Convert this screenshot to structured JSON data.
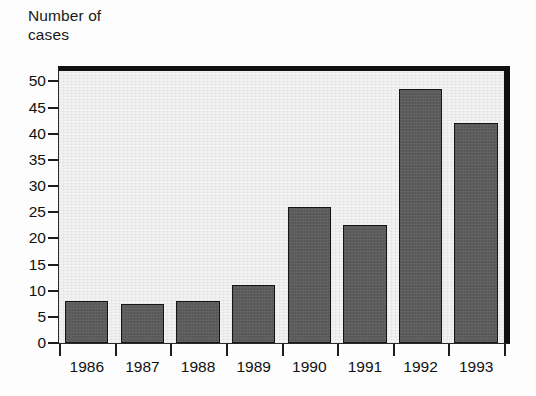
{
  "figure": {
    "background_color": "#fdfdfd",
    "plot_background_color": "#f2f2f2",
    "bar_color": "#5c5c5c",
    "bar_edge_color": "#151515",
    "axis_color": "#1d1d1d",
    "y_axis_title": "Number of\ncases"
  },
  "chart_data": {
    "type": "bar",
    "title": "",
    "subtitle": "",
    "xlabel": "",
    "ylabel": "Number of cases",
    "categories": [
      "1986",
      "1987",
      "1988",
      "1989",
      "1990",
      "1991",
      "1992",
      "1993"
    ],
    "values": [
      8,
      7.5,
      8,
      11,
      26,
      22.5,
      48.5,
      42
    ],
    "ylim": [
      0,
      52
    ],
    "yticks": [
      0,
      5,
      10,
      15,
      20,
      25,
      30,
      35,
      40,
      45,
      50
    ],
    "ytick_labels": [
      "0",
      "5",
      "10",
      "15",
      "20",
      "25",
      "30",
      "35",
      "40",
      "45",
      "50"
    ],
    "grid": false,
    "legend": null,
    "legend_position": "none",
    "annotations": [],
    "series": [
      {
        "name": "Number of cases",
        "values": [
          8,
          7.5,
          8,
          11,
          26,
          22.5,
          48.5,
          42
        ]
      }
    ]
  }
}
